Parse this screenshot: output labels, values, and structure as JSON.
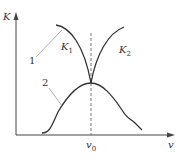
{
  "diagram": {
    "axes": {
      "y_label": "K",
      "x_label": "v"
    },
    "marker": {
      "label": "v",
      "subscript": "0"
    },
    "curves": [
      {
        "id": "K1",
        "label": "K",
        "subscript": "1",
        "description": "decreasing branch, falls toward v0"
      },
      {
        "id": "K2",
        "label": "K",
        "subscript": "2",
        "description": "increasing branch, rises after v0"
      },
      {
        "id": "curve2",
        "label": "2",
        "description": "bell-shaped curve peaking at v0"
      }
    ],
    "callouts": [
      {
        "id": "callout-1",
        "label": "1"
      },
      {
        "id": "callout-2",
        "label": "2"
      }
    ],
    "colors": {
      "line": "#333333",
      "leader": "#888888",
      "background": "#ffffff"
    }
  }
}
